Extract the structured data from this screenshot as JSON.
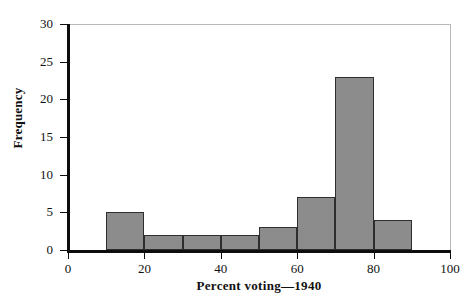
{
  "chart_data": {
    "type": "bar",
    "title": "",
    "subtitle": "",
    "xlabel": "Percent voting—1940",
    "ylabel": "Frequency",
    "xlim": [
      0,
      100
    ],
    "ylim": [
      0,
      30
    ],
    "xticks": [
      0,
      20,
      40,
      60,
      80,
      100
    ],
    "yticks": [
      0,
      5,
      10,
      15,
      20,
      25,
      30
    ],
    "xtick_labels": [
      "0",
      "20",
      "40",
      "60",
      "80",
      "100"
    ],
    "ytick_labels": [
      "0",
      "5",
      "10",
      "15",
      "20",
      "25",
      "30"
    ],
    "grid": false,
    "legend": null,
    "bin_width": 10,
    "bin_edges": [
      10,
      20,
      30,
      40,
      50,
      60,
      70,
      80,
      90
    ],
    "categories": [
      "10–20",
      "20–30",
      "30–40",
      "40–50",
      "50–60",
      "60–70",
      "70–80",
      "80–90"
    ],
    "values": [
      5,
      2,
      2,
      2,
      3,
      7,
      23,
      4
    ],
    "bars": [
      {
        "x0": 10,
        "x1": 20,
        "value": 5
      },
      {
        "x0": 20,
        "x1": 30,
        "value": 2
      },
      {
        "x0": 30,
        "x1": 40,
        "value": 2
      },
      {
        "x0": 40,
        "x1": 50,
        "value": 2
      },
      {
        "x0": 50,
        "x1": 60,
        "value": 3
      },
      {
        "x0": 60,
        "x1": 70,
        "value": 7
      },
      {
        "x0": 70,
        "x1": 80,
        "value": 23
      },
      {
        "x0": 80,
        "x1": 90,
        "value": 4
      }
    ],
    "colors": {
      "bar_fill": "#8c8c8c",
      "bar_edge": "#2e2e2e",
      "axis": "#0d0d0d",
      "frame": "#b9b9b9",
      "text": "#111111",
      "background": "#ffffff"
    }
  }
}
